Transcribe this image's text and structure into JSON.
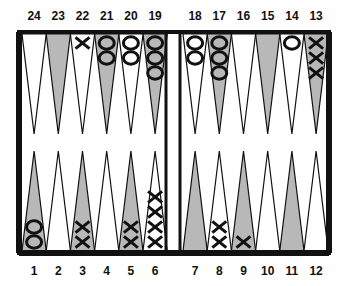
{
  "colors": {
    "border": "#111111",
    "shaded_point": "#b8b8b8",
    "light_point": "#ffffff",
    "checker_stroke": "#111111",
    "background": "#ffffff"
  },
  "board": {
    "top_labels": [
      "24",
      "23",
      "22",
      "21",
      "20",
      "19",
      "18",
      "17",
      "16",
      "15",
      "14",
      "13"
    ],
    "bottom_labels": [
      "1",
      "2",
      "3",
      "4",
      "5",
      "6",
      "7",
      "8",
      "9",
      "10",
      "11",
      "12"
    ],
    "points": [
      {
        "point": 1,
        "shaded": true,
        "checkers": {
          "type": "O",
          "count": 2
        }
      },
      {
        "point": 2,
        "shaded": false,
        "checkers": {
          "type": "",
          "count": 0
        }
      },
      {
        "point": 3,
        "shaded": true,
        "checkers": {
          "type": "X",
          "count": 2
        }
      },
      {
        "point": 4,
        "shaded": false,
        "checkers": {
          "type": "",
          "count": 0
        }
      },
      {
        "point": 5,
        "shaded": true,
        "checkers": {
          "type": "X",
          "count": 2
        }
      },
      {
        "point": 6,
        "shaded": false,
        "checkers": {
          "type": "X",
          "count": 4
        }
      },
      {
        "point": 7,
        "shaded": true,
        "checkers": {
          "type": "",
          "count": 0
        }
      },
      {
        "point": 8,
        "shaded": false,
        "checkers": {
          "type": "X",
          "count": 2
        }
      },
      {
        "point": 9,
        "shaded": true,
        "checkers": {
          "type": "X",
          "count": 1
        }
      },
      {
        "point": 10,
        "shaded": false,
        "checkers": {
          "type": "",
          "count": 0
        }
      },
      {
        "point": 11,
        "shaded": true,
        "checkers": {
          "type": "",
          "count": 0
        }
      },
      {
        "point": 12,
        "shaded": false,
        "checkers": {
          "type": "",
          "count": 0
        }
      },
      {
        "point": 13,
        "shaded": true,
        "checkers": {
          "type": "X",
          "count": 3
        }
      },
      {
        "point": 14,
        "shaded": false,
        "checkers": {
          "type": "O",
          "count": 1
        }
      },
      {
        "point": 15,
        "shaded": true,
        "checkers": {
          "type": "",
          "count": 0
        }
      },
      {
        "point": 16,
        "shaded": false,
        "checkers": {
          "type": "",
          "count": 0
        }
      },
      {
        "point": 17,
        "shaded": true,
        "checkers": {
          "type": "O",
          "count": 3
        }
      },
      {
        "point": 18,
        "shaded": false,
        "checkers": {
          "type": "O",
          "count": 2
        }
      },
      {
        "point": 19,
        "shaded": true,
        "checkers": {
          "type": "O",
          "count": 3
        }
      },
      {
        "point": 20,
        "shaded": false,
        "checkers": {
          "type": "O",
          "count": 2
        }
      },
      {
        "point": 21,
        "shaded": true,
        "checkers": {
          "type": "O",
          "count": 2
        }
      },
      {
        "point": 22,
        "shaded": false,
        "checkers": {
          "type": "X",
          "count": 1
        }
      },
      {
        "point": 23,
        "shaded": true,
        "checkers": {
          "type": "",
          "count": 0
        }
      },
      {
        "point": 24,
        "shaded": false,
        "checkers": {
          "type": "",
          "count": 0
        }
      }
    ]
  }
}
